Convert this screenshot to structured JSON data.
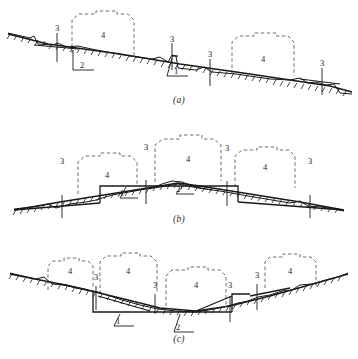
{
  "figure": {
    "type": "engineering-cross-section-diagram",
    "panel_count": 3,
    "callout_legend": [
      "1",
      "2",
      "3",
      "4"
    ],
    "stroke_color": "#1a1a1a",
    "dashed_color": "#6f6f6f",
    "ground_color": "#1a1a1a",
    "background": "#ffffff"
  },
  "panels": [
    {
      "id": "a",
      "caption": "(a)",
      "terrain": "sloping-hillside",
      "labels": [
        {
          "text": "3",
          "x": 52,
          "y": 31
        },
        {
          "text": "4",
          "x": 100,
          "y": 37
        },
        {
          "text": "2",
          "x": 82,
          "y": 66
        },
        {
          "text": "3",
          "x": 166,
          "y": 41
        },
        {
          "text": "1",
          "x": 176,
          "y": 72
        },
        {
          "text": "3",
          "x": 205,
          "y": 57
        },
        {
          "text": "4",
          "x": 262,
          "y": 60
        },
        {
          "text": "3",
          "x": 318,
          "y": 66
        }
      ]
    },
    {
      "id": "b",
      "caption": "(b)",
      "terrain": "hill-crest-embankment",
      "labels": [
        {
          "text": "3",
          "x": 57,
          "y": 163
        },
        {
          "text": "4",
          "x": 100,
          "y": 155
        },
        {
          "text": "3",
          "x": 141,
          "y": 149
        },
        {
          "text": "4",
          "x": 178,
          "y": 144
        },
        {
          "text": "1",
          "x": 121,
          "y": 192
        },
        {
          "text": "2",
          "x": 177,
          "y": 188
        },
        {
          "text": "3",
          "x": 222,
          "y": 150
        },
        {
          "text": "4",
          "x": 259,
          "y": 157
        },
        {
          "text": "3",
          "x": 305,
          "y": 163
        }
      ]
    },
    {
      "id": "c",
      "caption": "(c)",
      "terrain": "valley-cutting",
      "labels": [
        {
          "text": "4",
          "x": 63,
          "y": 272
        },
        {
          "text": "3",
          "x": 92,
          "y": 277
        },
        {
          "text": "4",
          "x": 118,
          "y": 272
        },
        {
          "text": "1",
          "x": 117,
          "y": 312
        },
        {
          "text": "3",
          "x": 150,
          "y": 287
        },
        {
          "text": "4",
          "x": 190,
          "y": 285
        },
        {
          "text": "2",
          "x": 178,
          "y": 320
        },
        {
          "text": "3",
          "x": 227,
          "y": 287
        },
        {
          "text": "3",
          "x": 252,
          "y": 277
        },
        {
          "text": "4",
          "x": 283,
          "y": 272
        }
      ]
    }
  ]
}
